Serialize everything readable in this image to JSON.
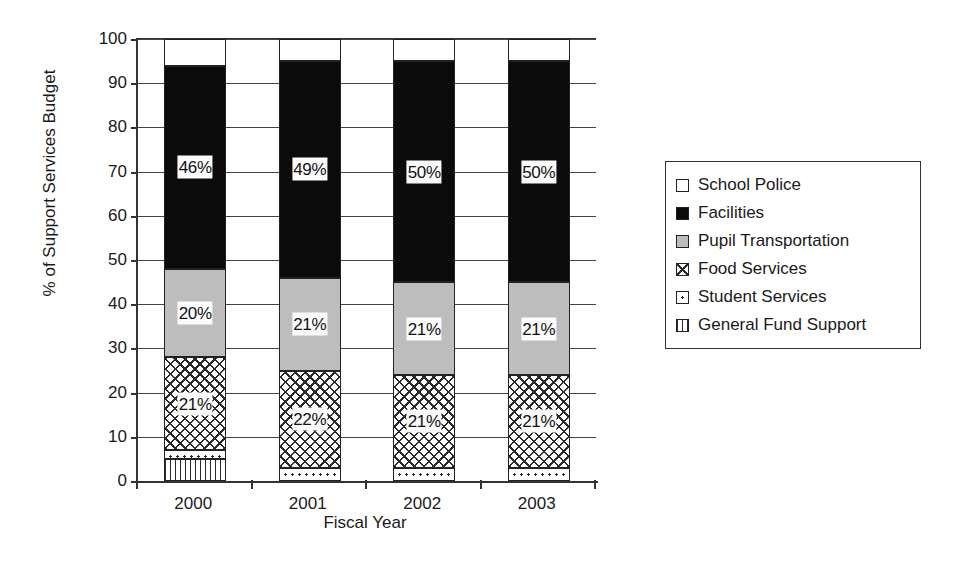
{
  "chart_data": {
    "type": "bar",
    "subtype": "stacked-bar-100-percent",
    "title": "",
    "xlabel": "Fiscal Year",
    "ylabel": "% of Support Services Budget",
    "ylim": [
      0,
      100
    ],
    "ytick_step": 10,
    "yticks": [
      0,
      10,
      20,
      30,
      40,
      50,
      60,
      70,
      80,
      90,
      100
    ],
    "grid": true,
    "legend_position": "right",
    "categories": [
      "2000",
      "2001",
      "2002",
      "2003"
    ],
    "series": [
      {
        "name": "General Fund Support",
        "pattern": "vertical-stripes",
        "color": "#ffffff",
        "values": [
          5,
          0,
          0,
          0
        ],
        "labels": [
          "",
          "",
          "",
          ""
        ]
      },
      {
        "name": "Student Services",
        "pattern": "dots",
        "color": "#ffffff",
        "values": [
          2,
          3,
          3,
          3
        ],
        "labels": [
          "",
          "",
          "",
          ""
        ]
      },
      {
        "name": "Food Services",
        "pattern": "crosshatch",
        "color": "#ffffff",
        "values": [
          21,
          22,
          21,
          21
        ],
        "labels": [
          "21%",
          "22%",
          "21%",
          "21%"
        ]
      },
      {
        "name": "Pupil Transportation",
        "pattern": "solid-gray",
        "color": "#bdbdbd",
        "values": [
          20,
          21,
          21,
          21
        ],
        "labels": [
          "20%",
          "21%",
          "21%",
          "21%"
        ]
      },
      {
        "name": "Facilities",
        "pattern": "solid-black",
        "color": "#0b0b0b",
        "values": [
          46,
          49,
          50,
          50
        ],
        "labels": [
          "46%",
          "49%",
          "50%",
          "50%"
        ]
      },
      {
        "name": "School Police",
        "pattern": "solid-white",
        "color": "#ffffff",
        "values": [
          6,
          5,
          5,
          5
        ],
        "labels": [
          "",
          "",
          "",
          ""
        ]
      }
    ]
  },
  "legend": {
    "items": [
      {
        "label": "School Police",
        "swatch": "solid-white"
      },
      {
        "label": "Facilities",
        "swatch": "solid-black"
      },
      {
        "label": "Pupil Transportation",
        "swatch": "solid-gray"
      },
      {
        "label": "Food Services",
        "swatch": "crosshatch"
      },
      {
        "label": "Student Services",
        "swatch": "dots"
      },
      {
        "label": "General Fund Support",
        "swatch": "vertical-stripes"
      }
    ]
  }
}
